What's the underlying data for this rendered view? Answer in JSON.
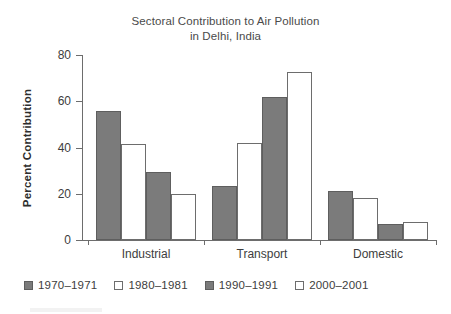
{
  "chart_data": {
    "type": "bar",
    "title": "Sectoral Contribution to Air Pollution in Delhi, India",
    "title_lines": [
      "Sectoral Contribution to Air Pollution",
      "in Delhi, India"
    ],
    "xlabel": "",
    "ylabel": "Percent Contribution",
    "ylim": [
      0,
      80
    ],
    "yticks": [
      0,
      20,
      40,
      60,
      80
    ],
    "ytick_labels": [
      "0",
      "20",
      "40",
      "60",
      "80"
    ],
    "grid": false,
    "legend_position": "bottom-left",
    "categories": [
      "Industrial",
      "Transport",
      "Domestic"
    ],
    "series": [
      {
        "name": "1970–1971",
        "style": "filled",
        "color": "#7b7b7b",
        "values": [
          56,
          23.5,
          21
        ]
      },
      {
        "name": "1980–1981",
        "style": "open",
        "color": "#ffffff",
        "values": [
          41.5,
          42,
          18
        ]
      },
      {
        "name": "1990–1991",
        "style": "filled",
        "color": "#7b7b7b",
        "values": [
          29.5,
          62,
          7
        ]
      },
      {
        "name": "2000–2001",
        "style": "open",
        "color": "#ffffff",
        "values": [
          20,
          72.5,
          8
        ]
      }
    ]
  },
  "colors": {
    "bar_fill_gray": "#7b7b7b",
    "bar_edge": "#6d6d6d",
    "axis": "#6d6d6d",
    "text": "#3d3d3d",
    "background": "#ffffff"
  }
}
